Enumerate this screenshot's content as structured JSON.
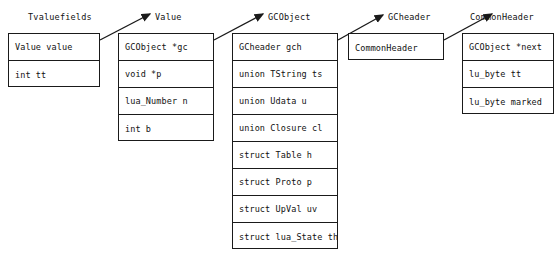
{
  "diagram": {
    "title_absent": true,
    "structs": [
      {
        "name": "Tvaluefields",
        "label_x": 28,
        "box_x": 8,
        "box_y": 33,
        "box_w": 92,
        "fields": [
          "Value value",
          "int tt"
        ]
      },
      {
        "name": "Value",
        "label_x": 155,
        "box_x": 118,
        "box_y": 33,
        "box_w": 96,
        "fields": [
          "GCObject *gc",
          "void *p",
          "lua_Number n",
          "int b"
        ]
      },
      {
        "name": "GCObject",
        "label_x": 268,
        "box_x": 232,
        "box_y": 33,
        "box_w": 106,
        "fields": [
          "GCheader gch",
          "union TString ts",
          "union Udata u",
          "union Closure cl",
          "struct Table h",
          "struct Proto p",
          "struct UpVal uv",
          "struct lua_State th"
        ]
      },
      {
        "name": "GCheader",
        "label_x": 388,
        "box_x": 348,
        "box_y": 33,
        "box_w": 96,
        "fields": [
          "CommonHeader"
        ]
      },
      {
        "name": "CommonHeader",
        "label_x": 470,
        "box_x": 462,
        "box_y": 33,
        "box_w": 92,
        "fields": [
          "GCObject *next",
          "lu_byte tt",
          "lu_byte marked"
        ]
      }
    ],
    "arrows": [
      {
        "from": "Tvaluefields",
        "to": "Value",
        "x1": 100,
        "y1": 40,
        "x2": 150,
        "y2": 14
      },
      {
        "from": "Value",
        "to": "GCObject",
        "x1": 214,
        "y1": 40,
        "x2": 263,
        "y2": 14
      },
      {
        "from": "GCObject",
        "to": "GCheader",
        "x1": 338,
        "y1": 40,
        "x2": 383,
        "y2": 15
      },
      {
        "from": "GCheader",
        "to": "CommonHeader",
        "x1": 444,
        "y1": 40,
        "x2": 492,
        "y2": 14
      }
    ],
    "colors": {
      "stroke": "#1a1a1a",
      "text": "#111111",
      "background": "#ffffff"
    }
  }
}
